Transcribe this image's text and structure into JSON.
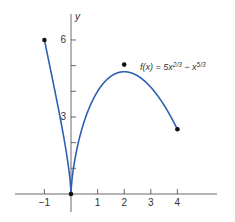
{
  "chart_data": {
    "type": "line",
    "title": "",
    "function_label": "f(x) = 5x^{2/3} − x^{5/3}",
    "function_label_parts": {
      "lhs": "f(x) = 5x",
      "exp1": "2/3",
      "mid": " − x",
      "exp2": "5/3"
    },
    "xlabel": "",
    "ylabel": "y",
    "xlim": [
      -1,
      4
    ],
    "ylim": [
      0,
      6
    ],
    "x_ticks": [
      -1,
      1,
      2,
      3,
      4
    ],
    "x_tick_labels": [
      "−1",
      "1",
      "2",
      "3",
      "4"
    ],
    "y_ticks": [
      1,
      2,
      3,
      4,
      5,
      6
    ],
    "y_tick_labels": {
      "3": "3",
      "6": "6"
    },
    "series": [
      {
        "name": "f(x) = 5x^(2/3) − x^(5/3)",
        "color": "#2f5fb3",
        "domain": [
          -1,
          4
        ],
        "x": [
          -1,
          -0.75,
          -0.5,
          -0.25,
          0,
          0.25,
          0.5,
          1,
          1.5,
          2,
          2.5,
          3,
          3.5,
          4
        ],
        "values": [
          6,
          4.57,
          3.47,
          2.18,
          0,
          1.82,
          2.83,
          4,
          4.66,
          5.04,
          5.04,
          4.33,
          3.69,
          2.52
        ]
      }
    ],
    "marked_points": [
      {
        "x": -1,
        "y": 6
      },
      {
        "x": 0,
        "y": 0
      },
      {
        "x": 2,
        "y": 5.04
      },
      {
        "x": 4,
        "y": 2.52
      }
    ],
    "grid": false,
    "legend": "none"
  }
}
